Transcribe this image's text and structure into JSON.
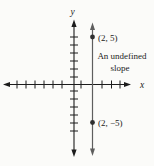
{
  "figure": {
    "background": "#fbfbf9",
    "axis_color": "#1c1c1c",
    "vertical_line_color": "#5e5e5e",
    "point_color": "#2f2f2f",
    "x_axis_label": "x",
    "y_axis_label": "y",
    "point_top_label": "(2, 5)",
    "point_bottom_label": "(2, −5)",
    "annotation_line1": "An undefined",
    "annotation_line2": "slope"
  },
  "chart_data": {
    "type": "scatter",
    "points": [
      {
        "x": 2,
        "y": 5,
        "label": "(2, 5)"
      },
      {
        "x": 2,
        "y": -5,
        "label": "(2, −5)"
      }
    ],
    "line": {
      "equation": "x = 2",
      "slope": "undefined"
    },
    "annotation": "An undefined slope",
    "xlabel": "x",
    "ylabel": "y",
    "xlim": [
      -7,
      6
    ],
    "ylim": [
      -7,
      7
    ],
    "grid": false,
    "legend": false
  }
}
